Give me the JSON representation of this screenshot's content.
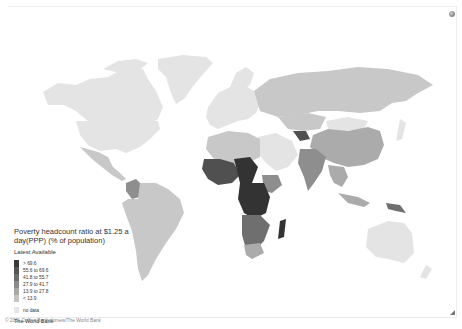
{
  "legend": {
    "title": "Poverty headcount ratio at $1.25 a day(PPP) (% of population)",
    "subtitle": "Latest Available",
    "classes": [
      {
        "label": "> 69.6",
        "color": "#3a3a3a"
      },
      {
        "label": "55.6 to 69.6",
        "color": "#555555"
      },
      {
        "label": "41.8 to 55.7",
        "color": "#6e6e6e"
      },
      {
        "label": "27.9 to 41.7",
        "color": "#8a8a8a"
      },
      {
        "label": "13.9 to 27.8",
        "color": "#a8a8a8"
      },
      {
        "label": "< 13.9",
        "color": "#c4c4c4"
      }
    ],
    "no_data": {
      "label": "no data",
      "color": "#e6e6e6"
    },
    "source": "The World Bank"
  },
  "copyright": "© 2011 Collins Bartholomew/The World Bank",
  "icons": {
    "top_right": "globe-icon",
    "bottom_right": "resize-handle-icon"
  },
  "colors": {
    "no_data": "#e4e4e4",
    "low": "#c8c8c8",
    "mid_low": "#ababab",
    "mid": "#8e8e8e",
    "mid_high": "#6f6f6f",
    "high": "#505050",
    "very_high": "#333333"
  }
}
